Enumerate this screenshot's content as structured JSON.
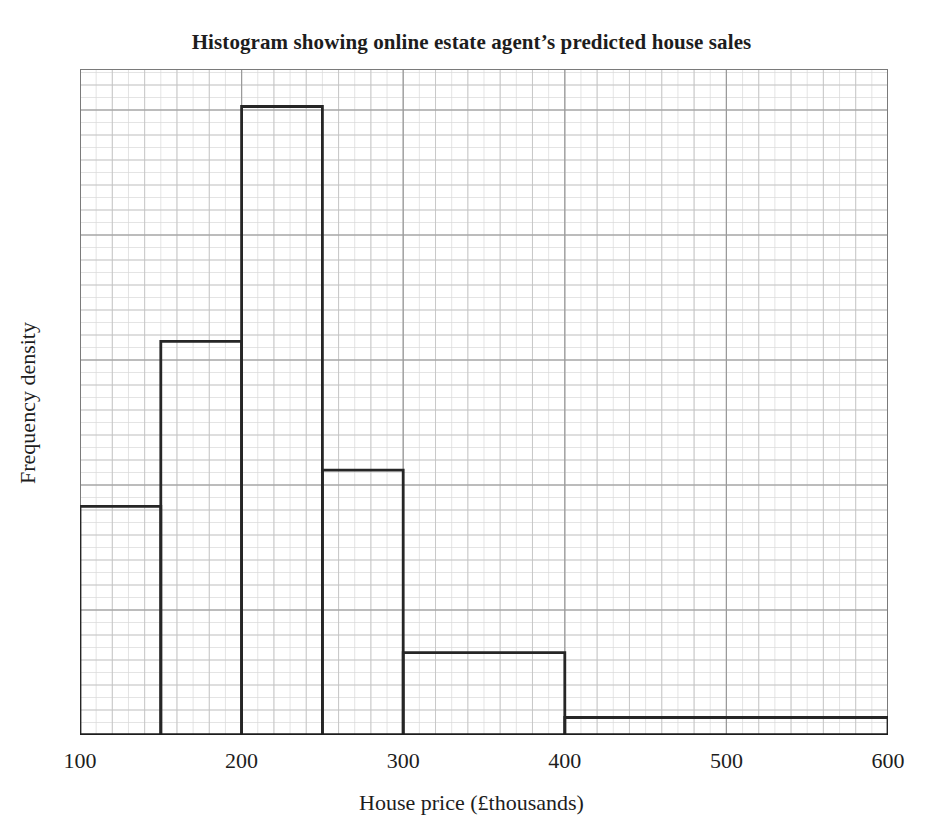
{
  "chart_data": {
    "type": "bar",
    "title": "Histogram showing online estate agent’s predicted house sales",
    "xlabel": "House price (£thousands)",
    "ylabel": "Frequency density",
    "xlim": [
      100,
      600
    ],
    "ylim": [
      0,
      5.33
    ],
    "xticks": [
      100,
      200,
      300,
      400,
      500,
      600
    ],
    "xtick_labels": [
      "100",
      "200",
      "300",
      "400",
      "500",
      "600"
    ],
    "yticks": [],
    "ytick_labels": [],
    "grid": "major and minor gridlines shown, graph-paper style",
    "legend": "none",
    "bar_style": "unfilled outline bars, black stroke",
    "bins": [
      {
        "label": "100–150",
        "x_start": 100,
        "x_end": 150,
        "width": 50,
        "frequency_density": 1.83
      },
      {
        "label": "150–200",
        "x_start": 150,
        "x_end": 200,
        "width": 50,
        "frequency_density": 3.15
      },
      {
        "label": "200–250",
        "x_start": 200,
        "x_end": 250,
        "width": 50,
        "frequency_density": 5.03
      },
      {
        "label": "250–300",
        "x_start": 250,
        "x_end": 300,
        "width": 50,
        "frequency_density": 2.12
      },
      {
        "label": "300–400",
        "x_start": 300,
        "x_end": 400,
        "width": 100,
        "frequency_density": 0.66
      },
      {
        "label": "400–600",
        "x_start": 400,
        "x_end": 600,
        "width": 200,
        "frequency_density": 0.14
      }
    ],
    "categories": [
      "100–150",
      "150–200",
      "200–250",
      "250–300",
      "300–400",
      "400–600"
    ],
    "values": [
      1.83,
      3.15,
      5.03,
      2.12,
      0.66,
      0.14
    ],
    "colors": {
      "bar_stroke": "#262626",
      "axis": "#1d1d1d",
      "major_grid": "#9a9a9a",
      "minor_grid": "#d8d8d8",
      "text": "#1d1d1d",
      "background": "#ffffff"
    }
  }
}
